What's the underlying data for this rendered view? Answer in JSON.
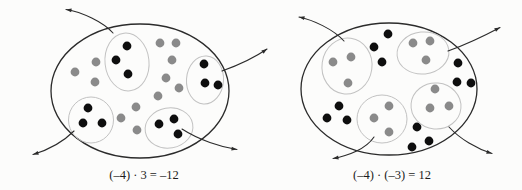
{
  "figure": {
    "type": "integer-multiplication-counter-model",
    "colors": {
      "background": "#fcfcfb",
      "outline": "#2b2b2b",
      "group_outline": "#c2c2c2",
      "black_counter": "#0e0e0e",
      "gray_counter": "#8a8a8a",
      "caption_text": "#1c1c1c"
    },
    "dot_radius": 4.4,
    "panels": [
      {
        "id": "left",
        "caption": "(–4) · 3 = –12",
        "ellipse": {
          "cx": 140,
          "cy": 91,
          "rx": 89,
          "ry": 67
        },
        "group_dot_color": "black",
        "loose_dot_color": "gray",
        "groups": [
          {
            "outline": {
              "cx": 127,
              "cy": 62,
              "rx": 22,
              "ry": 29,
              "rotate": -6
            },
            "dots": [
              [
                127,
                46
              ],
              [
                116,
                60
              ],
              [
                128,
                74
              ]
            ]
          },
          {
            "outline": {
              "cx": 205,
              "cy": 80,
              "rx": 18.5,
              "ry": 24,
              "rotate": 4
            },
            "dots": [
              [
                204,
                64
              ],
              [
                205,
                83
              ],
              [
                218,
                85
              ]
            ]
          },
          {
            "outline": {
              "cx": 91,
              "cy": 120,
              "rx": 22.5,
              "ry": 23,
              "rotate": 0
            },
            "dots": [
              [
                88,
                108
              ],
              [
                83,
                123
              ],
              [
                102,
                123
              ]
            ]
          },
          {
            "outline": {
              "cx": 169,
              "cy": 128,
              "rx": 24,
              "ry": 20,
              "rotate": -10
            },
            "dots": [
              [
                159,
                124
              ],
              [
                174,
                119
              ],
              [
                178,
                134
              ]
            ]
          }
        ],
        "loose_dots": [
          [
            75,
            72
          ],
          [
            96,
            62
          ],
          [
            95,
            82
          ],
          [
            160,
            43
          ],
          [
            176,
            43
          ],
          [
            172,
            60
          ],
          [
            166,
            78
          ],
          [
            179,
            88
          ],
          [
            158,
            96
          ],
          [
            121,
            118
          ],
          [
            136,
            107
          ],
          [
            137,
            130
          ]
        ],
        "arrows": [
          {
            "path": "M113,33 C103,22 82,12 66,9.5",
            "tip": [
              66,
              9.5
            ],
            "angle": 189
          },
          {
            "path": "M222,71 C236,66 254,58 267,49",
            "tip": [
              267,
              49
            ],
            "angle": -35
          },
          {
            "path": "M74,131 C63,142 48,150 33,154.5",
            "tip": [
              33,
              154.5
            ],
            "angle": 163
          },
          {
            "path": "M182,129 C199,140 221,147 237,149.5",
            "tip": [
              237,
              149.5
            ],
            "angle": 9
          }
        ]
      },
      {
        "id": "right",
        "caption": "(–4) · (–3) = 12",
        "ellipse": {
          "cx": 389,
          "cy": 89,
          "rx": 88,
          "ry": 66
        },
        "group_dot_color": "gray",
        "loose_dot_color": "black",
        "groups": [
          {
            "outline": {
              "cx": 347,
              "cy": 66,
              "rx": 25,
              "ry": 28,
              "rotate": 8
            },
            "dots": [
              [
                333,
                62
              ],
              [
                351,
                57
              ],
              [
                348,
                83
              ]
            ]
          },
          {
            "outline": {
              "cx": 423,
              "cy": 53,
              "rx": 26,
              "ry": 21,
              "rotate": -6
            },
            "dots": [
              [
                413,
                43
              ],
              [
                430,
                41
              ],
              [
                426,
                60
              ]
            ]
          },
          {
            "outline": {
              "cx": 436,
              "cy": 106,
              "rx": 25,
              "ry": 23,
              "rotate": 5
            },
            "dots": [
              [
                435,
                89
              ],
              [
                430,
                108
              ],
              [
                449,
                106
              ]
            ]
          },
          {
            "outline": {
              "cx": 382,
              "cy": 119,
              "rx": 25,
              "ry": 24,
              "rotate": 0
            },
            "dots": [
              [
                389,
                106
              ],
              [
                374,
                118
              ],
              [
                389,
                132
              ]
            ]
          }
        ],
        "loose_dots": [
          [
            388,
            34
          ],
          [
            374,
            47
          ],
          [
            382,
            62
          ],
          [
            458,
            63
          ],
          [
            457,
            82
          ],
          [
            471,
            83
          ],
          [
            339,
            106
          ],
          [
            327,
            118
          ],
          [
            347,
            120
          ],
          [
            417,
            127
          ],
          [
            412,
            147
          ],
          [
            429,
            141
          ]
        ],
        "arrows": [
          {
            "path": "M344,41 C333,29 313,20 299,17",
            "tip": [
              299,
              17
            ],
            "angle": 192
          },
          {
            "path": "M448,51 C462,46 484,36 500,27.5",
            "tip": [
              500,
              27.5
            ],
            "angle": -28
          },
          {
            "path": "M374,137 C366,149 348,156 333,158.5",
            "tip": [
              333,
              158.5
            ],
            "angle": 170
          },
          {
            "path": "M449,127 C460,139 477,149 492,153.5",
            "tip": [
              492,
              153.5
            ],
            "angle": 17
          }
        ]
      }
    ]
  }
}
